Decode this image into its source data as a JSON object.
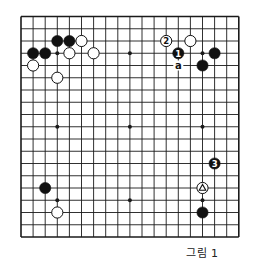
{
  "diagram": {
    "type": "go-board",
    "size": 19,
    "caption": "그림 1",
    "colors": {
      "line": "#1a1a1a",
      "black": "#111111",
      "white": "#ffffff",
      "background": "#ffffff"
    },
    "star_points": [
      [
        3,
        3
      ],
      [
        9,
        3
      ],
      [
        15,
        3
      ],
      [
        3,
        9
      ],
      [
        9,
        9
      ],
      [
        15,
        9
      ],
      [
        3,
        15
      ],
      [
        9,
        15
      ],
      [
        15,
        15
      ]
    ],
    "stones": [
      {
        "color": "black",
        "col": 3,
        "row": 2,
        "label": ""
      },
      {
        "color": "black",
        "col": 4,
        "row": 2,
        "label": ""
      },
      {
        "color": "white",
        "col": 5,
        "row": 2,
        "label": ""
      },
      {
        "color": "black",
        "col": 1,
        "row": 3,
        "label": ""
      },
      {
        "color": "black",
        "col": 2,
        "row": 3,
        "label": ""
      },
      {
        "color": "white",
        "col": 4,
        "row": 3,
        "label": ""
      },
      {
        "color": "white",
        "col": 6,
        "row": 3,
        "label": ""
      },
      {
        "color": "white",
        "col": 1,
        "row": 4,
        "label": ""
      },
      {
        "color": "white",
        "col": 3,
        "row": 5,
        "label": ""
      },
      {
        "color": "white",
        "col": 12,
        "row": 2,
        "label": "2"
      },
      {
        "color": "white",
        "col": 14,
        "row": 2,
        "label": ""
      },
      {
        "color": "black",
        "col": 13,
        "row": 3,
        "label": "1"
      },
      {
        "color": "black",
        "col": 16,
        "row": 3,
        "label": ""
      },
      {
        "color": "black",
        "col": 15,
        "row": 4,
        "label": ""
      },
      {
        "color": "black",
        "col": 16,
        "row": 12,
        "label": "3"
      },
      {
        "color": "white",
        "col": 15,
        "row": 14,
        "label": "triangle"
      },
      {
        "color": "black",
        "col": 15,
        "row": 16,
        "label": ""
      },
      {
        "color": "black",
        "col": 2,
        "row": 14,
        "label": ""
      },
      {
        "color": "white",
        "col": 3,
        "row": 16,
        "label": ""
      }
    ],
    "markers": [
      {
        "col": 13,
        "row": 4,
        "text": "a"
      }
    ]
  }
}
